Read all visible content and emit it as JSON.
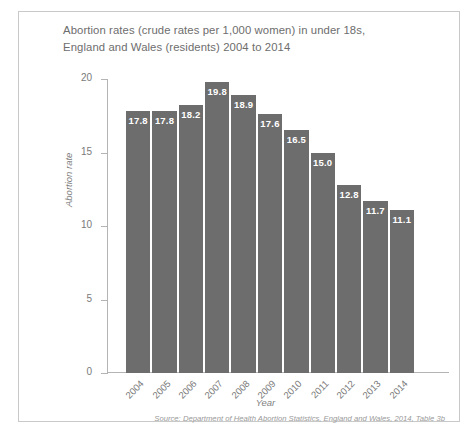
{
  "chart_data": {
    "type": "bar",
    "title": "Abortion rates (crude rates per 1,000 women) in under 18s, England and Wales (residents) 2004 to 2014",
    "title_line1": "Abortion rates (crude rates per 1,000 women) in under 18s,",
    "title_line2": "England and Wales (residents) 2004 to 2014",
    "xlabel": "Year",
    "ylabel": "Abortion rate",
    "categories": [
      "2004",
      "2005",
      "2006",
      "2007",
      "2008",
      "2009",
      "2010",
      "2011",
      "2012",
      "2013",
      "2014"
    ],
    "values": [
      17.8,
      17.8,
      18.2,
      19.8,
      18.9,
      17.6,
      16.5,
      15.0,
      12.8,
      11.7,
      11.1
    ],
    "value_labels": [
      "17.8",
      "17.8",
      "18.2",
      "19.8",
      "18.9",
      "17.6",
      "16.5",
      "15.0",
      "12.8",
      "11.7",
      "11.1"
    ],
    "ylim": [
      0,
      20
    ],
    "yticks": [
      20,
      15,
      10,
      5,
      0
    ],
    "ytick_labels": [
      "20",
      "15",
      "10",
      "5",
      "0"
    ],
    "grid": false,
    "legend": false,
    "bar_color": "#6d6d6d",
    "value_label_color": "#ffffff",
    "axis_color": "#b4b4b4",
    "text_color": "#7a7a7a",
    "source_note": "Source: Department of Health Abortion Statistics, England and Wales, 2014, Table 3b"
  }
}
